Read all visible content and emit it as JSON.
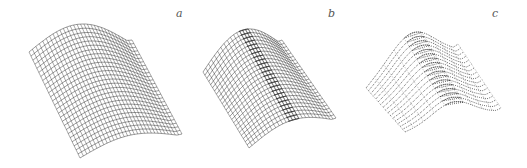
{
  "figure": {
    "background": "#ffffff",
    "ink_color": "#1a1a1a",
    "panels": [
      {
        "id": "a",
        "label": "a",
        "label_pos": [
          176,
          7
        ],
        "style": "grid",
        "description": "Wire-mesh cylindrical (saddle-like) surface, evenly spaced grid",
        "corners": {
          "tl": [
            29,
            52
          ],
          "tr": [
            132,
            40
          ],
          "br": [
            182,
            134
          ],
          "bl": [
            80,
            158
          ]
        },
        "ridge_lift": 22,
        "fold": 0,
        "wave": 0,
        "rows": 26,
        "cols": 30
      },
      {
        "id": "b",
        "label": "b",
        "label_pos": [
          328,
          7
        ],
        "style": "grid",
        "description": "Wire-mesh surface with crease forming dense fold toward right tip",
        "corners": {
          "tl": [
            203,
            72
          ],
          "tr": [
            282,
            40
          ],
          "br": [
            336,
            118
          ],
          "bl": [
            249,
            148
          ]
        },
        "ridge_lift": 26,
        "fold": 0.6,
        "wave": 0,
        "rows": 24,
        "cols": 30
      },
      {
        "id": "c",
        "label": "c",
        "label_pos": [
          492,
          7
        ],
        "style": "dotted",
        "description": "Dotted-line surface with wavy cross sections and a sharp fold",
        "corners": {
          "tl": [
            366,
            88
          ],
          "tr": [
            458,
            44
          ],
          "br": [
            501,
            108
          ],
          "bl": [
            405,
            132
          ]
        },
        "ridge_lift": 30,
        "fold": 0.9,
        "wave": 3,
        "rows": 16,
        "cols": 36
      }
    ]
  }
}
